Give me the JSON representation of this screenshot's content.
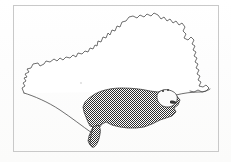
{
  "figure": {
    "kind": "map",
    "title": "",
    "caption": "",
    "region_name": "Dorset",
    "frame": {
      "x": 13,
      "y": 5,
      "width": 205,
      "height": 146,
      "stroke_color": "#c9c9c9"
    },
    "background_color": "#fdfdfc",
    "outline_color": "#4a4a4a",
    "shade_color": "#3a3a3a",
    "shade_pattern": "stipple-checker",
    "legend": [],
    "labels": [],
    "features": [
      {
        "name": "county-boundary",
        "type": "outline",
        "label": ""
      },
      {
        "name": "shaded-coastal-area",
        "type": "filled-region",
        "fill": "stipple",
        "label": ""
      },
      {
        "name": "harbour-enclave",
        "type": "unshaded-inclusion",
        "label": ""
      },
      {
        "name": "portland-peninsula",
        "type": "filled-region",
        "fill": "stipple",
        "label": ""
      },
      {
        "name": "southern-coastline",
        "type": "line",
        "label": ""
      }
    ]
  }
}
